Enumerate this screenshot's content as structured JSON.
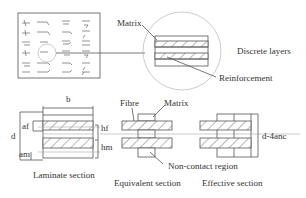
{
  "top": {
    "labels": {
      "matrix": "Matrix",
      "reinforcement": "Reinforcement",
      "discrete_layers": "Discrete layers"
    }
  },
  "laminate": {
    "dims": {
      "b": "b",
      "d": "d",
      "af": "af",
      "am": "am",
      "hf": "hf",
      "hm": "hm"
    },
    "caption": "Laminate section"
  },
  "equivalent": {
    "labels": {
      "fibre": "Fibre",
      "matrix": "Matrix",
      "non_contact": "Non-contact region"
    },
    "caption": "Equivalent section"
  },
  "effective": {
    "dim": "d-4anc",
    "caption": "Effective section"
  },
  "colors": {
    "line": "#555555",
    "hatch": "#666666",
    "background": "#ffffff"
  }
}
